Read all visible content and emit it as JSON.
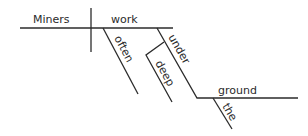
{
  "diagram": {
    "type": "sentence-diagram",
    "sentence": "Miners often work deep under the ground",
    "subject": "Miners",
    "verb": "work",
    "modifiers": {
      "often": "often",
      "preposition": "under",
      "deep": "deep",
      "object": "ground",
      "article": "the"
    },
    "line_color": "#2b2b2b"
  }
}
